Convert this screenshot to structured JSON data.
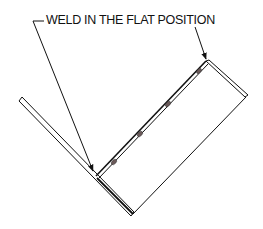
{
  "diagram": {
    "title": "WELD IN THE FLAT POSITION",
    "labels": [
      {
        "id": "callout",
        "text": "WELD IN THE FLAT POSITION"
      }
    ],
    "elements": {
      "left_plate": {
        "from": [
          20,
          99
        ],
        "to": [
          132,
          215
        ],
        "style": "double-line"
      },
      "right_plate": {
        "corners": [
          [
            207,
            62
          ],
          [
            246,
            95
          ],
          [
            132,
            213
          ],
          [
            97,
            176
          ]
        ],
        "style": "outline"
      },
      "weld_joint": {
        "from": [
          97,
          176
        ],
        "to": [
          205,
          63
        ]
      },
      "tack_welds": [
        [
          115,
          162
        ],
        [
          139,
          134
        ],
        [
          168,
          105
        ]
      ],
      "leader_lines": [
        {
          "from": [
            35,
            21
          ],
          "to": [
            95,
            174
          ],
          "arrow": true
        },
        {
          "from": [
            192,
            21
          ],
          "to": [
            207,
            62
          ],
          "arrow": true
        }
      ]
    },
    "colors": {
      "line": "#111111",
      "tack": "#6b5a5a",
      "background": "#ffffff"
    }
  }
}
